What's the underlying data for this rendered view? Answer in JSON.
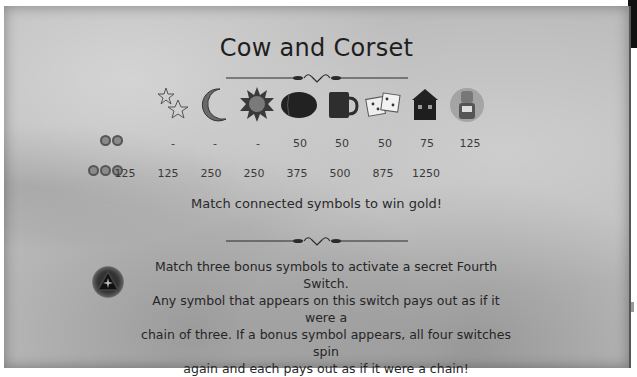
{
  "title": "Cow and Corset",
  "symbols": [
    {
      "name": "stars",
      "icon": "stars-icon",
      "two": "-",
      "three": "125"
    },
    {
      "name": "moon",
      "icon": "moon-icon",
      "two": "-",
      "three": "125"
    },
    {
      "name": "sun",
      "icon": "sun-icon",
      "two": "-",
      "three": "250"
    },
    {
      "name": "barrel",
      "icon": "barrel-icon",
      "two": "50",
      "three": "250"
    },
    {
      "name": "tankard",
      "icon": "tankard-icon",
      "two": "50",
      "three": "375"
    },
    {
      "name": "dice",
      "icon": "dice-icon",
      "two": "50",
      "three": "500"
    },
    {
      "name": "tavern",
      "icon": "tavern-icon",
      "two": "75",
      "three": "875"
    },
    {
      "name": "cow",
      "icon": "cow-icon",
      "two": "125",
      "three": "1250"
    }
  ],
  "rows": {
    "two_label": "2 coins",
    "three_label": "3 coins"
  },
  "tagline": "Match connected symbols to win gold!",
  "bonus": {
    "lines": [
      "Match three bonus symbols to activate a secret Fourth Switch.",
      "Any symbol that appears on this switch pays out as if it were a",
      "chain of three. If a bonus symbol appears, all four switches spin",
      "again and each pays out as if it were a chain!"
    ]
  }
}
